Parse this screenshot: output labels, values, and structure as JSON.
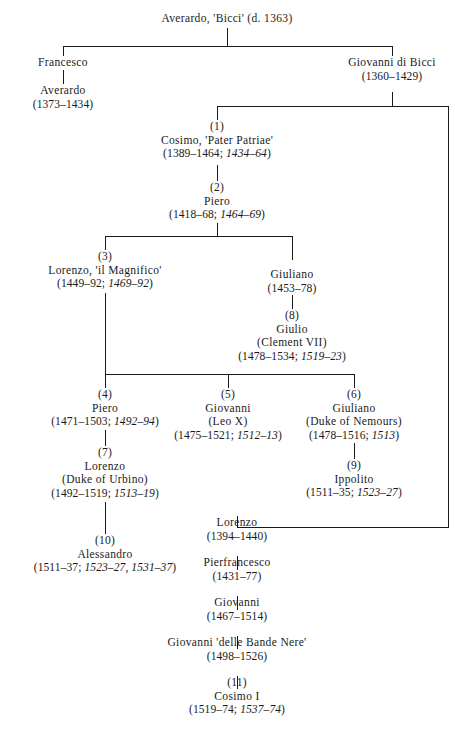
{
  "diagram": {
    "line_color": "#1a1a1a",
    "background": "#ffffff"
  },
  "nodes": {
    "averardo_bicci": {
      "num": "",
      "name": "Averardo, 'Bicci' (d. 1363)",
      "sub": "",
      "life": "",
      "reign": ""
    },
    "francesco": {
      "num": "",
      "name": "Francesco",
      "sub": "",
      "life": "",
      "reign": ""
    },
    "averardo": {
      "num": "",
      "name": "Averardo",
      "sub": "",
      "life": "(1373–1434)",
      "reign": ""
    },
    "giovanni_di_bicci": {
      "num": "",
      "name": "Giovanni di Bicci",
      "sub": "",
      "life": "(1360–1429)",
      "reign": ""
    },
    "cosimo_pater": {
      "num": "(1)",
      "name": "Cosimo, 'Pater Patriae'",
      "sub": "",
      "life": "(1389–1464; ",
      "reign": "1434–64",
      "life_close": ")"
    },
    "piero_2": {
      "num": "(2)",
      "name": "Piero",
      "sub": "",
      "life": "(1418–68; ",
      "reign": "1464–69",
      "life_close": ")"
    },
    "lorenzo_magnifico": {
      "num": "(3)",
      "name": "Lorenzo, 'il Magnifico'",
      "sub": "",
      "life": "(1449–92; ",
      "reign": "1469–92",
      "life_close": ")"
    },
    "giuliano_1453": {
      "num": "",
      "name": "Giuliano",
      "sub": "",
      "life": "(1453–78)",
      "reign": ""
    },
    "giulio_clement": {
      "num": "(8)",
      "name": "Giulio",
      "sub": "(Clement VII)",
      "life": "(1478–1534; ",
      "reign": "1519–23",
      "life_close": ")"
    },
    "piero_4": {
      "num": "(4)",
      "name": "Piero",
      "sub": "",
      "life": "(1471–1503; ",
      "reign": "1492–94",
      "life_close": ")"
    },
    "giovanni_leo": {
      "num": "(5)",
      "name": "Giovanni",
      "sub": "(Leo X)",
      "life": "(1475–1521; ",
      "reign": "1512–13",
      "life_close": ")"
    },
    "giuliano_nemours": {
      "num": "(6)",
      "name": "Giuliano",
      "sub": "(Duke of Nemours)",
      "life": "(1478–1516; ",
      "reign": "1513",
      "life_close": ")"
    },
    "lorenzo_urbino": {
      "num": "(7)",
      "name": "Lorenzo",
      "sub": "(Duke of Urbino)",
      "life": "(1492–1519; ",
      "reign": "1513–19",
      "life_close": ")"
    },
    "ippolito": {
      "num": "(9)",
      "name": "Ippolito",
      "sub": "",
      "life": "(1511–35; ",
      "reign": "1523–27",
      "life_close": ")"
    },
    "alessandro": {
      "num": "(10)",
      "name": "Alessandro",
      "sub": "",
      "life": "(1511–37; ",
      "reign": "1523–27, 1531–37",
      "life_close": ")"
    },
    "lorenzo_1394": {
      "num": "",
      "name": "Lorenzo",
      "sub": "",
      "life": "(1394–1440)",
      "reign": ""
    },
    "pierfrancesco": {
      "num": "",
      "name": "Pierfrancesco",
      "sub": "",
      "life": "(1431–77)",
      "reign": ""
    },
    "giovanni_1467": {
      "num": "",
      "name": "Giovanni",
      "sub": "",
      "life": "(1467–1514)",
      "reign": ""
    },
    "giovanni_bande_nere": {
      "num": "",
      "name": "Giovanni 'delle Bande Nere'",
      "sub": "",
      "life": "(1498–1526)",
      "reign": ""
    },
    "cosimo_i": {
      "num": "(11)",
      "name": "Cosimo I",
      "sub": "",
      "life": "(1519–74; ",
      "reign": "1537–74",
      "life_close": ")"
    }
  }
}
